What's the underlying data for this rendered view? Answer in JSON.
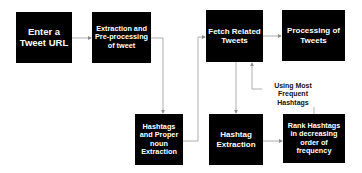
{
  "diagram": {
    "type": "flowchart",
    "nodes": [
      {
        "id": "enter_url",
        "label": "Enter a Tweet URL"
      },
      {
        "id": "extract_preprocess",
        "label": "Extraction and Pre-processing of tweet"
      },
      {
        "id": "fetch_related",
        "label": "Fetch Related Tweets"
      },
      {
        "id": "processing",
        "label": "Processing of Tweets"
      },
      {
        "id": "hashtag_noun",
        "label": "Hashtags and Proper noun Extraction"
      },
      {
        "id": "hashtag_extract",
        "label": "Hashtag Extraction"
      },
      {
        "id": "rank",
        "label": "Rank Hashtags in decreasing order of frequency"
      }
    ],
    "edges": [
      {
        "from": "enter_url",
        "to": "extract_preprocess",
        "label": ""
      },
      {
        "from": "extract_preprocess",
        "to": "hashtag_noun",
        "label": ""
      },
      {
        "from": "hashtag_noun",
        "to": "fetch_related",
        "label": ""
      },
      {
        "from": "fetch_related",
        "to": "processing",
        "label": ""
      },
      {
        "from": "fetch_related",
        "to": "hashtag_extract",
        "label": ""
      },
      {
        "from": "hashtag_extract",
        "to": "rank",
        "label": ""
      },
      {
        "from": "rank",
        "to": "fetch_related",
        "label": "Using Most Frequent Hashtags"
      }
    ],
    "edge_label": "Using Most Frequent Hashtags"
  },
  "colors": {
    "node_fill": "#000000",
    "node_text": "#ffffff",
    "edge": "#9a9a9a"
  }
}
